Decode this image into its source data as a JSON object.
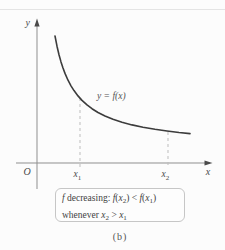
{
  "figure": {
    "background": "#fcfcfc",
    "top_rule_color": "#e4e4e4"
  },
  "axes": {
    "y_label": "y",
    "x_label": "x",
    "origin_label": "O",
    "line_color": "#8f8f8f",
    "arrow_color": "#4a4a4a"
  },
  "curve": {
    "label": "y = f(x)",
    "color": "#3c3c3c",
    "points": [
      [
        55,
        36
      ],
      [
        57,
        46.2
      ],
      [
        59,
        54.7
      ],
      [
        61,
        61.9
      ],
      [
        63,
        68
      ],
      [
        65,
        73.4
      ],
      [
        68,
        80.2
      ],
      [
        71,
        85.8
      ],
      [
        74,
        90.6
      ],
      [
        78,
        95.9
      ],
      [
        82,
        100.4
      ],
      [
        87,
        104.9
      ],
      [
        92,
        108.7
      ],
      [
        98,
        112.5
      ],
      [
        105,
        116
      ],
      [
        113,
        119.3
      ],
      [
        122,
        122.3
      ],
      [
        132,
        124.9
      ],
      [
        143,
        127.3
      ],
      [
        155,
        129.3
      ],
      [
        167,
        131
      ],
      [
        179,
        132.5
      ],
      [
        190,
        133.6
      ]
    ]
  },
  "ticks": {
    "dash_color": "#bdbdbd",
    "x1": {
      "base": "x",
      "sub": "1"
    },
    "x2": {
      "base": "x",
      "sub": "2"
    }
  },
  "caption": {
    "box_border": "#c6c6c6",
    "line1": [
      {
        "t": "f",
        "k": "i"
      },
      {
        "t": " decreasing: ",
        "k": "r"
      },
      {
        "t": "f",
        "k": "i"
      },
      {
        "t": "(",
        "k": "r"
      },
      {
        "t": "x",
        "k": "i"
      },
      {
        "t": "2",
        "k": "s"
      },
      {
        "t": ")",
        "k": "r"
      },
      {
        "t": " < ",
        "k": "r"
      },
      {
        "t": "f",
        "k": "i"
      },
      {
        "t": "(",
        "k": "r"
      },
      {
        "t": "x",
        "k": "i"
      },
      {
        "t": "1",
        "k": "s"
      },
      {
        "t": ")",
        "k": "r"
      }
    ],
    "line2": [
      {
        "t": "whenever ",
        "k": "r"
      },
      {
        "t": "x",
        "k": "i"
      },
      {
        "t": "2",
        "k": "s"
      },
      {
        "t": " > ",
        "k": "r"
      },
      {
        "t": "x",
        "k": "i"
      },
      {
        "t": "1",
        "k": "s"
      }
    ]
  },
  "subfigure_label": "(b)"
}
